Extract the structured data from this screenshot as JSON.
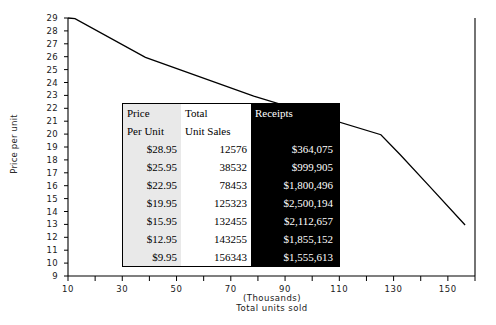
{
  "chart_data": {
    "type": "line",
    "title": "",
    "xlabel": "Total units sold",
    "xlabel_sub": "(Thousands)",
    "ylabel": "Price per unit",
    "xlim": [
      10,
      160
    ],
    "ylim": [
      9,
      29
    ],
    "grid": false,
    "legend": "none",
    "x_ticks": [
      10,
      20,
      30,
      40,
      50,
      60,
      70,
      80,
      90,
      100,
      110,
      120,
      130,
      140,
      150,
      160
    ],
    "x_tick_labels": [
      "10",
      "",
      "30",
      "",
      "50",
      "",
      "70",
      "",
      "90",
      "",
      "110",
      "",
      "130",
      "",
      "150",
      ""
    ],
    "y_ticks": [
      9,
      10,
      11,
      12,
      13,
      14,
      15,
      16,
      17,
      18,
      19,
      20,
      21,
      22,
      23,
      24,
      25,
      26,
      27,
      28,
      29
    ],
    "y_tick_labels": [
      "9",
      "10",
      "11",
      "12",
      "13",
      "14",
      "15",
      "16",
      "17",
      "18",
      "19",
      "20",
      "21",
      "22",
      "23",
      "24",
      "25",
      "26",
      "27",
      "28",
      "29"
    ],
    "series": [
      {
        "name": "Demand curve",
        "x": [
          10,
          12.576,
          38.532,
          78.453,
          125.323,
          132.455,
          143.255,
          156.343
        ],
        "y": [
          29,
          28.95,
          25.95,
          22.95,
          19.95,
          18.4,
          15.95,
          12.95
        ],
        "color": "#000000"
      }
    ],
    "points_plotted": [
      {
        "units_thousands": 10,
        "price": 29
      },
      {
        "units_thousands": 12.576,
        "price": 28.95
      },
      {
        "units_thousands": 38.532,
        "price": 25.95
      },
      {
        "units_thousands": 78.453,
        "price": 22.95
      },
      {
        "units_thousands": 125.323,
        "price": 19.95
      },
      {
        "units_thousands": 132.455,
        "price": 15.95
      },
      {
        "units_thousands": 143.255,
        "price": 12.95
      },
      {
        "units_thousands": 156.343,
        "price": 9.95
      }
    ]
  },
  "table": {
    "headers_line1": [
      "Price",
      "Total",
      "Receipts"
    ],
    "headers_line2": [
      "Per Unit",
      "Unit Sales",
      ""
    ],
    "rows": [
      {
        "price": "$28.95",
        "units": "12576",
        "receipts": "$364,075"
      },
      {
        "price": "$25.95",
        "units": "38532",
        "receipts": "$999,905"
      },
      {
        "price": "$22.95",
        "units": "78453",
        "receipts": "$1,800,496"
      },
      {
        "price": "$19.95",
        "units": "125323",
        "receipts": "$2,500,194"
      },
      {
        "price": "$15.95",
        "units": "132455",
        "receipts": "$2,112,657"
      },
      {
        "price": "$12.95",
        "units": "143255",
        "receipts": "$1,855,152"
      },
      {
        "price": "$9.95",
        "units": "156343",
        "receipts": "$1,555,613"
      }
    ]
  },
  "colors": {
    "line": "#000000",
    "axis": "#000000",
    "price_column_bg": "#e9e9e9",
    "receipts_column_bg": "#000000",
    "receipts_text": "#ffffff",
    "background": "#ffffff"
  }
}
